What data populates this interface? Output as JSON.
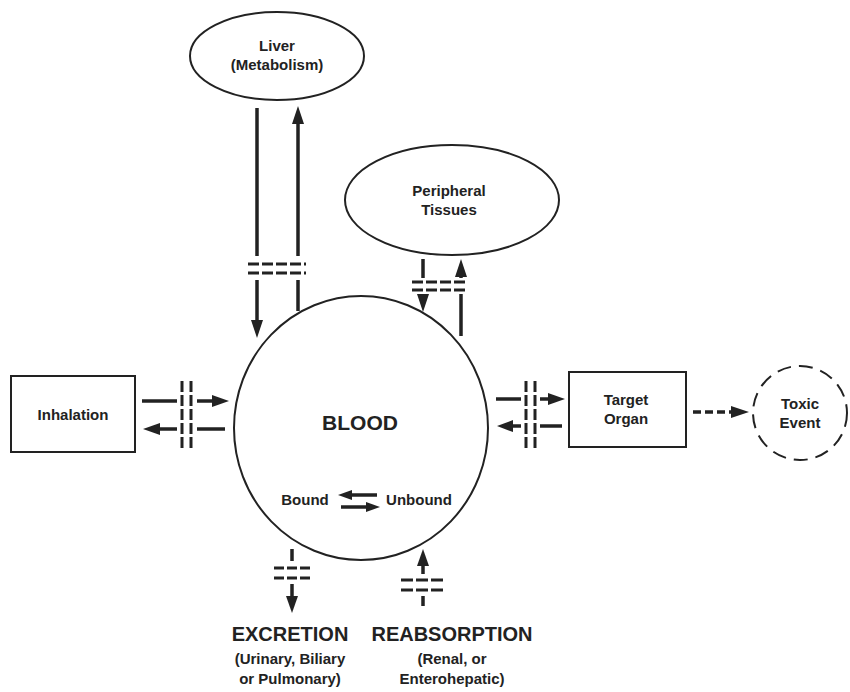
{
  "diagram": {
    "nodes": {
      "liver": {
        "line1": "Liver",
        "line2": "(Metabolism)"
      },
      "peripheral": {
        "line1": "Peripheral",
        "line2": "Tissues"
      },
      "blood": {
        "label": "BLOOD",
        "bound": "Bound",
        "unbound": "Unbound"
      },
      "inhalation": {
        "label": "Inhalation"
      },
      "target": {
        "line1": "Target",
        "line2": "Organ"
      },
      "toxic": {
        "line1": "Toxic",
        "line2": "Event"
      },
      "excretion": {
        "title": "EXCRETION",
        "line1": "(Urinary, Biliary",
        "line2": "or Pulmonary)"
      },
      "reabsorption": {
        "title": "REABSORPTION",
        "line1": "(Renal, or",
        "line2": "Enterohepatic)"
      }
    },
    "edges": [
      {
        "from": "blood",
        "to": "liver",
        "type": "solid-barrier"
      },
      {
        "from": "liver",
        "to": "blood",
        "type": "solid-barrier"
      },
      {
        "from": "blood",
        "to": "peripheral",
        "type": "solid-barrier"
      },
      {
        "from": "peripheral",
        "to": "blood",
        "type": "solid-barrier"
      },
      {
        "from": "inhalation",
        "to": "blood",
        "type": "solid-barrier"
      },
      {
        "from": "blood",
        "to": "inhalation",
        "type": "solid-barrier"
      },
      {
        "from": "blood",
        "to": "target",
        "type": "solid-barrier"
      },
      {
        "from": "target",
        "to": "blood",
        "type": "solid-barrier"
      },
      {
        "from": "target",
        "to": "toxic",
        "type": "dashed"
      },
      {
        "from": "blood",
        "to": "excretion",
        "type": "solid-barrier"
      },
      {
        "from": "reabsorption",
        "to": "blood",
        "type": "solid-barrier"
      },
      {
        "from": "bound",
        "to": "unbound",
        "type": "equilibrium"
      }
    ],
    "colors": {
      "ink": "#222222",
      "background": "#ffffff"
    }
  }
}
